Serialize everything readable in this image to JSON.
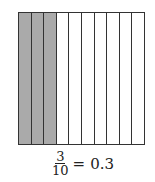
{
  "diagram": {
    "columns": 10,
    "shaded": 3,
    "shade_color": "#aaaaaa",
    "line_color": "#333333"
  },
  "equation": {
    "numerator": "3",
    "denominator": "10",
    "equals": "=",
    "decimal": "0.3"
  }
}
